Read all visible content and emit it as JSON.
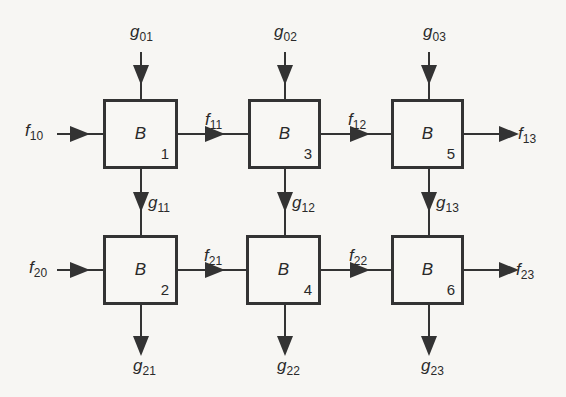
{
  "diagram": {
    "block_symbol": "B",
    "blocks": [
      {
        "id": "1",
        "label": "B",
        "number": "1",
        "x": 103,
        "y": 99
      },
      {
        "id": "3",
        "label": "B",
        "number": "3",
        "x": 248,
        "y": 99
      },
      {
        "id": "5",
        "label": "B",
        "number": "5",
        "x": 391,
        "y": 99
      },
      {
        "id": "2",
        "label": "B",
        "number": "2",
        "x": 103,
        "y": 235
      },
      {
        "id": "4",
        "label": "B",
        "number": "4",
        "x": 246,
        "y": 235
      },
      {
        "id": "6",
        "label": "B",
        "number": "6",
        "x": 391,
        "y": 235
      }
    ],
    "labels": {
      "g01": {
        "base": "g",
        "sub": "01"
      },
      "g02": {
        "base": "g",
        "sub": "02"
      },
      "g03": {
        "base": "g",
        "sub": "03"
      },
      "f10": {
        "base": "f",
        "sub": "10"
      },
      "f11": {
        "base": "f",
        "sub": "11"
      },
      "f12": {
        "base": "f",
        "sub": "12"
      },
      "f13": {
        "base": "f",
        "sub": "13"
      },
      "g11": {
        "base": "g",
        "sub": "11"
      },
      "g12": {
        "base": "g",
        "sub": "12"
      },
      "g13": {
        "base": "g",
        "sub": "13"
      },
      "f20": {
        "base": "f",
        "sub": "20"
      },
      "f21": {
        "base": "f",
        "sub": "21"
      },
      "f22": {
        "base": "f",
        "sub": "22"
      },
      "f23": {
        "base": "f",
        "sub": "23"
      },
      "g21": {
        "base": "g",
        "sub": "21"
      },
      "g22": {
        "base": "g",
        "sub": "22"
      },
      "g23": {
        "base": "g",
        "sub": "23"
      }
    },
    "colors": {
      "line": "#333333",
      "background": "#f7f6f3"
    }
  }
}
